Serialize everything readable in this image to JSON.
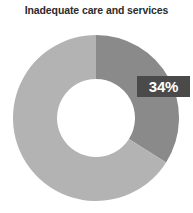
{
  "chart_data": {
    "type": "pie",
    "variant": "donut",
    "title": "Inadequate care and services",
    "xlabel": "",
    "ylabel": "",
    "legend": "none",
    "grid": false,
    "hole_ratio": 0.47,
    "start_angle_deg": 0,
    "direction": "clockwise",
    "units": "percent",
    "categories": [
      "Inadequate care and services",
      "Other"
    ],
    "values": [
      34,
      66
    ],
    "labels": [
      "34%",
      ""
    ],
    "colors": [
      "#8a8a8a",
      "#b3b3b3"
    ],
    "slices": [
      {
        "name": "Inadequate care and services",
        "value": 34,
        "label": "34%",
        "color": "#8a8a8a",
        "highlighted": true
      },
      {
        "name": "Other",
        "value": 66,
        "label": "",
        "color": "#b3b3b3",
        "highlighted": false
      }
    ],
    "annotations": [
      {
        "text": "34%",
        "style": "boxed-callout",
        "box_color": "#4a4a4a",
        "text_color": "#ffffff"
      }
    ]
  },
  "palette": {
    "background": "#ffffff",
    "title_color": "#2b2b2b",
    "segment_highlight": "#8a8a8a",
    "segment_base": "#b3b3b3",
    "callout_background": "#4a4a4a",
    "callout_text": "#ffffff"
  }
}
